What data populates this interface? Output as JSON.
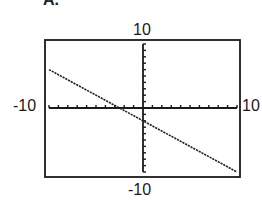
{
  "figure": {
    "partial_label": "A."
  },
  "chart_data": {
    "type": "line",
    "title": "",
    "xlabel": "",
    "ylabel": "",
    "xlim": [
      -10,
      10
    ],
    "ylim": [
      -10,
      10
    ],
    "x_tick_step": 1,
    "y_tick_step": 1,
    "grid": false,
    "window_labels": {
      "ymax": "10",
      "ymin": "-10",
      "xmin": "-10",
      "xmax": "10"
    },
    "series": [
      {
        "name": "line",
        "equation_estimate": "y = -0.8x - 2",
        "x": [
          -10,
          10
        ],
        "y": [
          6,
          -10
        ],
        "style": "dotted-pixel"
      }
    ],
    "intercepts_estimate": {
      "x_intercept": -2.5,
      "y_intercept": -2
    }
  },
  "colors": {
    "axis": "#1a1a1a",
    "line": "#222222",
    "background": "#ffffff"
  }
}
